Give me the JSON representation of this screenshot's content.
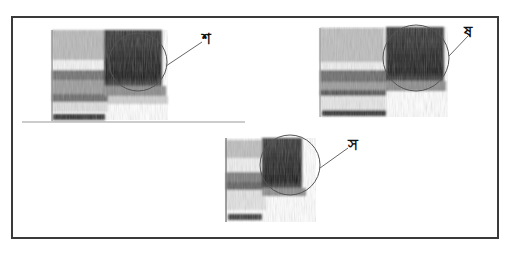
{
  "figure": {
    "panels": [
      {
        "id": "panel-1",
        "label": "শ",
        "annotation": "circled fricative noise region"
      },
      {
        "id": "panel-2",
        "label": "ষ",
        "annotation": "circled fricative noise region"
      },
      {
        "id": "panel-3",
        "label": "স",
        "annotation": "circled fricative noise region"
      }
    ]
  },
  "colors": {
    "frame": "#3a3a3a",
    "dark_noise": "#2a2a2a",
    "mid_gray": "#8a8a8a",
    "light_gray": "#cfcfcf"
  }
}
